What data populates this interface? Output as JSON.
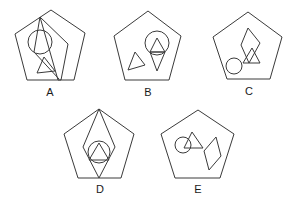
{
  "options": [
    {
      "id": "A",
      "label": "A",
      "contents": [
        "pentagon",
        "tilted-quadrilateral",
        "circle",
        "triangle"
      ]
    },
    {
      "id": "B",
      "label": "B",
      "contents": [
        "pentagon",
        "circle",
        "triangle-in-circle",
        "diamond",
        "small-triangle"
      ]
    },
    {
      "id": "C",
      "label": "C",
      "contents": [
        "pentagon",
        "diamond",
        "triangle",
        "circle"
      ]
    },
    {
      "id": "D",
      "label": "D",
      "contents": [
        "pentagon",
        "diamond",
        "circle",
        "triangle"
      ]
    },
    {
      "id": "E",
      "label": "E",
      "contents": [
        "pentagon",
        "circle",
        "triangle",
        "diamond"
      ]
    }
  ],
  "stroke_color": "#3a3a3a",
  "background": "#ffffff"
}
